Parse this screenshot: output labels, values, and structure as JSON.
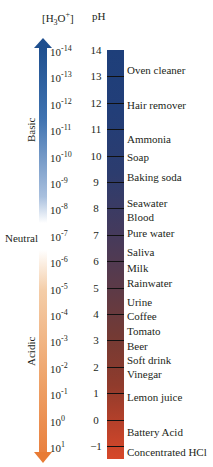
{
  "header": {
    "concentration": "[H3O+]",
    "concentration_parts": [
      "[H",
      "3",
      "O",
      "+",
      "]"
    ],
    "ph": "pH"
  },
  "side_labels": {
    "basic": "Basic",
    "neutral": "Neutral",
    "acidic": "Acidic"
  },
  "colors": {
    "basic_arrow": "#1f4f8f",
    "acidic_arrow": "#e87b35",
    "bar_top": "#1e3f7a",
    "bar_bottom": "#d7482a"
  },
  "scale": [
    {
      "ph": "14",
      "conc_base": "10",
      "conc_exp": "-14"
    },
    {
      "ph": "13",
      "conc_base": "10",
      "conc_exp": "-13"
    },
    {
      "ph": "12",
      "conc_base": "10",
      "conc_exp": "-12"
    },
    {
      "ph": "11",
      "conc_base": "10",
      "conc_exp": "-11"
    },
    {
      "ph": "10",
      "conc_base": "10",
      "conc_exp": "-10"
    },
    {
      "ph": "9",
      "conc_base": "10",
      "conc_exp": "-9"
    },
    {
      "ph": "8",
      "conc_base": "10",
      "conc_exp": "-8"
    },
    {
      "ph": "7",
      "conc_base": "10",
      "conc_exp": "-7"
    },
    {
      "ph": "6",
      "conc_base": "10",
      "conc_exp": "-6"
    },
    {
      "ph": "5",
      "conc_base": "10",
      "conc_exp": "-5"
    },
    {
      "ph": "4",
      "conc_base": "10",
      "conc_exp": "-4"
    },
    {
      "ph": "3",
      "conc_base": "10",
      "conc_exp": "-3"
    },
    {
      "ph": "2",
      "conc_base": "10",
      "conc_exp": "-2"
    },
    {
      "ph": "1",
      "conc_base": "10",
      "conc_exp": "-1"
    },
    {
      "ph": "0",
      "conc_base": "10",
      "conc_exp": "0"
    },
    {
      "ph": "−1",
      "conc_base": "10",
      "conc_exp": "1"
    }
  ],
  "substances": [
    {
      "name": "Oven cleaner",
      "ph_approx": 13.5
    },
    {
      "name": "Hair remover",
      "ph_approx": 12.5
    },
    {
      "name": "Ammonia",
      "ph_approx": 10.5
    },
    {
      "name": "Soap",
      "ph_approx": 10
    },
    {
      "name": "Baking soda",
      "ph_approx": 9
    },
    {
      "name": "Seawater",
      "ph_approx": 8
    },
    {
      "name": "Blood",
      "ph_approx": 7.4
    },
    {
      "name": "Pure water",
      "ph_approx": 7
    },
    {
      "name": "Saliva",
      "ph_approx": 6.5
    },
    {
      "name": "Milk",
      "ph_approx": 6.1
    },
    {
      "name": "Rainwater",
      "ph_approx": 5.6
    },
    {
      "name": "Urine",
      "ph_approx": 4.8
    },
    {
      "name": "Coffee",
      "ph_approx": 4.4
    },
    {
      "name": "Tomato",
      "ph_approx": 3.9
    },
    {
      "name": "Beer",
      "ph_approx": 3.4
    },
    {
      "name": "Soft drink",
      "ph_approx": 3
    },
    {
      "name": "Vinegar",
      "ph_approx": 2.6
    },
    {
      "name": "Lemon juice",
      "ph_approx": 1.8
    },
    {
      "name": "Battery Acid",
      "ph_approx": 0
    },
    {
      "name": "Concentrated HCl",
      "ph_approx": -1
    }
  ]
}
